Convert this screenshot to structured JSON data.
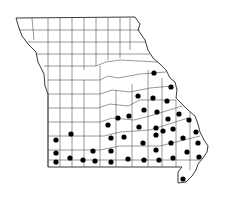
{
  "map": {
    "region": "Missouri",
    "subdivision": "counties",
    "colors": {
      "background": "#ffffff",
      "border": "#222222",
      "county_line": "#444444",
      "dot": "#000000"
    },
    "dot_radius": 2.6,
    "dots": [
      [
        154,
        73
      ],
      [
        171,
        87
      ],
      [
        138,
        96
      ],
      [
        153,
        98
      ],
      [
        167,
        101
      ],
      [
        144,
        110
      ],
      [
        157,
        112
      ],
      [
        179,
        114
      ],
      [
        118,
        118
      ],
      [
        129,
        116
      ],
      [
        168,
        119
      ],
      [
        189,
        120
      ],
      [
        108,
        125
      ],
      [
        139,
        127
      ],
      [
        156,
        128
      ],
      [
        163,
        131
      ],
      [
        173,
        129
      ],
      [
        196,
        132
      ],
      [
        71,
        134
      ],
      [
        111,
        138
      ],
      [
        124,
        137
      ],
      [
        156,
        135
      ],
      [
        183,
        138
      ],
      [
        56,
        140
      ],
      [
        143,
        143
      ],
      [
        171,
        143
      ],
      [
        198,
        143
      ],
      [
        156,
        150
      ],
      [
        93,
        151
      ],
      [
        111,
        151
      ],
      [
        187,
        152
      ],
      [
        56,
        153
      ],
      [
        70,
        158
      ],
      [
        199,
        157
      ],
      [
        173,
        158
      ],
      [
        128,
        159
      ],
      [
        144,
        160
      ],
      [
        159,
        160
      ],
      [
        83,
        160
      ],
      [
        95,
        161
      ],
      [
        111,
        162
      ],
      [
        56,
        162
      ],
      [
        183,
        179
      ]
    ]
  }
}
